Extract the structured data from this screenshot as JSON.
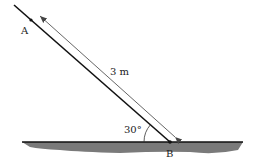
{
  "diagram": {
    "labels": {
      "point_a": "A",
      "point_b": "B",
      "length": "3 m",
      "angle": "30°"
    },
    "colors": {
      "rod": "#111111",
      "arrow": "#555555",
      "ground_fill": "#7a7a7a",
      "ground_line": "#111111"
    }
  }
}
